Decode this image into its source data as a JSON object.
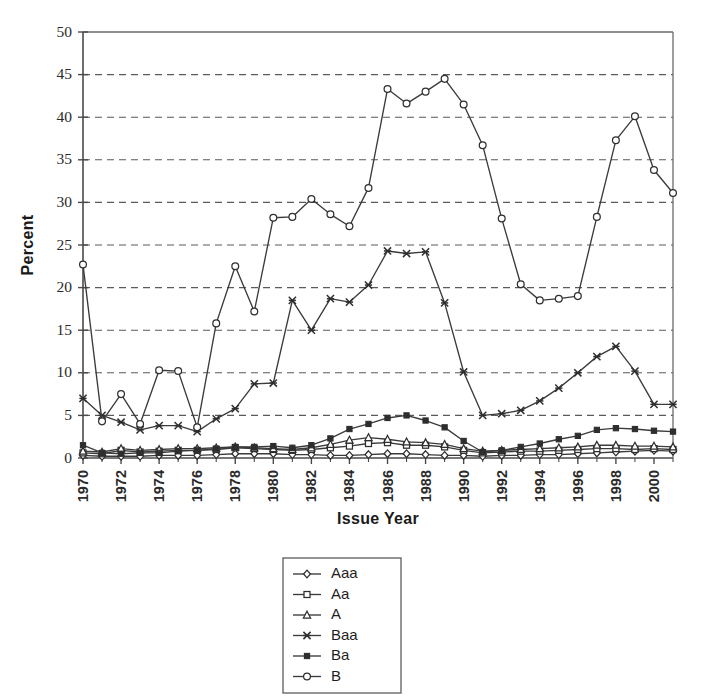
{
  "chart_data": {
    "type": "line",
    "title": "",
    "xlabel": "Issue Year",
    "ylabel": "Percent",
    "xlim": [
      1970,
      2001
    ],
    "ylim": [
      0,
      50
    ],
    "ytick_step": 5,
    "yticks": [
      "0",
      "5",
      "10",
      "15",
      "20",
      "25",
      "30",
      "35",
      "40",
      "45",
      "50"
    ],
    "x": [
      1970,
      1971,
      1972,
      1973,
      1974,
      1975,
      1976,
      1977,
      1978,
      1979,
      1980,
      1981,
      1982,
      1983,
      1984,
      1985,
      1986,
      1987,
      1988,
      1989,
      1990,
      1991,
      1992,
      1993,
      1994,
      1995,
      1996,
      1997,
      1998,
      1999,
      2000,
      2001
    ],
    "xtick_labels": [
      "1970",
      "1972",
      "1974",
      "1976",
      "1978",
      "1980",
      "1982",
      "1984",
      "1986",
      "1988",
      "1990",
      "1992",
      "1994",
      "1996",
      "1998",
      "2000"
    ],
    "xtick_values": [
      1970,
      1972,
      1974,
      1976,
      1978,
      1980,
      1982,
      1984,
      1986,
      1988,
      1990,
      1992,
      1994,
      1996,
      1998,
      2000
    ],
    "grid": true,
    "grid_axis": "y",
    "legend_position": "below-center",
    "series": [
      {
        "name": "Aaa",
        "marker": "open-diamond",
        "values": [
          0.3,
          0.2,
          0.2,
          0.2,
          0.3,
          0.3,
          0.3,
          0.4,
          0.5,
          0.5,
          0.5,
          0.4,
          0.4,
          0.3,
          0.3,
          0.4,
          0.5,
          0.5,
          0.4,
          0.3,
          0.3,
          0.2,
          0.3,
          0.3,
          0.4,
          0.4,
          0.5,
          0.6,
          0.7,
          0.8,
          0.9,
          0.8
        ]
      },
      {
        "name": "Aa",
        "marker": "open-square",
        "values": [
          0.6,
          0.5,
          0.9,
          0.7,
          0.8,
          0.9,
          0.9,
          1.0,
          1.2,
          1.1,
          1.0,
          0.9,
          1.0,
          1.2,
          1.4,
          1.7,
          1.8,
          1.5,
          1.5,
          1.3,
          0.9,
          0.6,
          0.7,
          0.8,
          0.8,
          0.9,
          1.0,
          1.1,
          1.1,
          1.0,
          1.1,
          1.0
        ]
      },
      {
        "name": "A",
        "marker": "open-triangle",
        "values": [
          0.8,
          0.7,
          1.1,
          0.9,
          1.0,
          1.1,
          1.1,
          1.2,
          1.3,
          1.2,
          1.1,
          1.0,
          1.2,
          1.6,
          2.1,
          2.4,
          2.2,
          1.9,
          1.8,
          1.6,
          1.1,
          0.8,
          0.9,
          1.0,
          1.1,
          1.2,
          1.3,
          1.5,
          1.5,
          1.4,
          1.4,
          1.3
        ]
      },
      {
        "name": "Baa",
        "marker": "cross",
        "values": [
          7.0,
          5.0,
          4.2,
          3.3,
          3.8,
          3.8,
          3.1,
          4.6,
          5.8,
          8.7,
          8.8,
          18.5,
          15.0,
          18.7,
          18.3,
          20.3,
          24.3,
          24.0,
          24.2,
          18.2,
          10.1,
          5.0,
          5.2,
          5.6,
          6.7,
          8.2,
          10.0,
          11.9,
          13.1,
          10.2,
          6.3,
          6.3
        ]
      },
      {
        "name": "Ba",
        "marker": "solid-square",
        "values": [
          1.5,
          0.6,
          0.5,
          0.6,
          0.6,
          0.8,
          0.9,
          1.1,
          1.3,
          1.3,
          1.4,
          1.2,
          1.5,
          2.3,
          3.4,
          4.0,
          4.7,
          5.0,
          4.4,
          3.6,
          2.0,
          0.7,
          0.9,
          1.3,
          1.7,
          2.2,
          2.6,
          3.3,
          3.5,
          3.4,
          3.2,
          3.1
        ]
      },
      {
        "name": "B",
        "marker": "open-circle",
        "values": [
          22.7,
          4.3,
          7.5,
          4.0,
          10.3,
          10.2,
          3.6,
          15.8,
          22.5,
          17.2,
          28.2,
          28.3,
          30.4,
          28.6,
          27.2,
          31.7,
          43.3,
          41.6,
          43.0,
          44.5,
          41.5,
          36.7,
          28.1,
          20.4,
          18.5,
          18.7,
          19.0,
          28.3,
          37.3,
          40.1,
          33.8,
          31.1
        ]
      }
    ]
  },
  "legend": {
    "entries": [
      {
        "label": "Aaa",
        "marker": "open-diamond"
      },
      {
        "label": "Aa",
        "marker": "open-square"
      },
      {
        "label": "A",
        "marker": "open-triangle"
      },
      {
        "label": "Baa",
        "marker": "cross"
      },
      {
        "label": "Ba",
        "marker": "solid-square"
      },
      {
        "label": "B",
        "marker": "open-circle"
      }
    ]
  },
  "colors": {
    "line": "#3b3b3b",
    "marker_stroke": "#2e2e2e",
    "marker_fill": "#ffffff",
    "grid": "#5a5a5a",
    "axis": "#4a4a4a",
    "text": "#231f20",
    "background": "#ffffff"
  }
}
